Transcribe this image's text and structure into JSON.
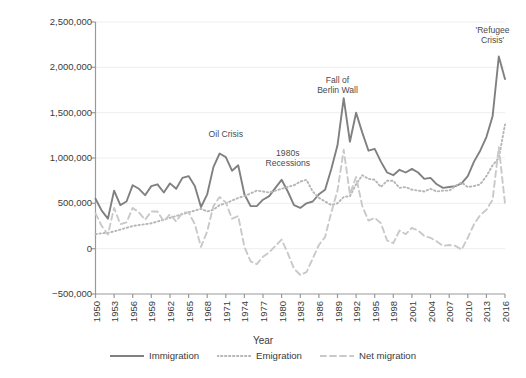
{
  "chart_data": {
    "type": "line",
    "title": "",
    "xlabel": "Year",
    "ylabel": "Migration",
    "ylim": [
      -500000,
      2500000
    ],
    "xlim": [
      1950,
      2016
    ],
    "grid": true,
    "legend_position": "bottom",
    "ytick_labels": [
      "2,500,000",
      "2,000,000",
      "1,500,000",
      "1,000,000",
      "500,000",
      "0",
      "−500,000"
    ],
    "ytick_values": [
      2500000,
      2000000,
      1500000,
      1000000,
      500000,
      0,
      -500000
    ],
    "xtick_labels": [
      "1950",
      "1953",
      "1956",
      "1959",
      "1962",
      "1965",
      "1968",
      "1971",
      "1974",
      "1977",
      "1980",
      "1983",
      "1986",
      "1989",
      "1992",
      "1995",
      "1998",
      "2001",
      "2004",
      "2007",
      "2010",
      "2013",
      "2016"
    ],
    "xtick_values": [
      1950,
      1953,
      1956,
      1959,
      1962,
      1965,
      1968,
      1971,
      1974,
      1977,
      1980,
      1983,
      1986,
      1989,
      1992,
      1995,
      1998,
      2001,
      2004,
      2007,
      2010,
      2013,
      2016
    ],
    "x": [
      1950,
      1951,
      1952,
      1953,
      1954,
      1955,
      1956,
      1957,
      1958,
      1959,
      1960,
      1961,
      1962,
      1963,
      1964,
      1965,
      1966,
      1967,
      1968,
      1969,
      1970,
      1971,
      1972,
      1973,
      1974,
      1975,
      1976,
      1977,
      1978,
      1979,
      1980,
      1981,
      1982,
      1983,
      1984,
      1985,
      1986,
      1987,
      1988,
      1989,
      1990,
      1991,
      1992,
      1993,
      1994,
      1995,
      1996,
      1997,
      1998,
      1999,
      2000,
      2001,
      2002,
      2003,
      2004,
      2005,
      2006,
      2007,
      2008,
      2009,
      2010,
      2011,
      2012,
      2013,
      2014,
      2015,
      2016
    ],
    "series": [
      {
        "name": "Immigration",
        "style": "solid",
        "color": "#808080",
        "values": [
          550000,
          420000,
          330000,
          640000,
          480000,
          520000,
          700000,
          660000,
          590000,
          690000,
          710000,
          620000,
          720000,
          660000,
          780000,
          800000,
          690000,
          460000,
          600000,
          900000,
          1050000,
          1010000,
          860000,
          920000,
          600000,
          470000,
          470000,
          540000,
          580000,
          670000,
          760000,
          630000,
          480000,
          450000,
          500000,
          520000,
          600000,
          650000,
          880000,
          1140000,
          1660000,
          1180000,
          1500000,
          1280000,
          1080000,
          1100000,
          960000,
          840000,
          810000,
          870000,
          840000,
          880000,
          840000,
          770000,
          780000,
          710000,
          670000,
          680000,
          690000,
          720000,
          800000,
          960000,
          1080000,
          1230000,
          1460000,
          2120000,
          1870000
        ]
      },
      {
        "name": "Emigration",
        "style": "dotted",
        "color": "#b6b6b6",
        "values": [
          160000,
          170000,
          175000,
          190000,
          210000,
          230000,
          250000,
          260000,
          270000,
          280000,
          300000,
          320000,
          340000,
          360000,
          380000,
          400000,
          420000,
          440000,
          410000,
          430000,
          480000,
          500000,
          530000,
          560000,
          580000,
          610000,
          640000,
          630000,
          620000,
          640000,
          660000,
          680000,
          700000,
          740000,
          760000,
          630000,
          560000,
          520000,
          480000,
          500000,
          570000,
          580000,
          710000,
          810000,
          770000,
          760000,
          680000,
          750000,
          750000,
          670000,
          680000,
          650000,
          640000,
          630000,
          660000,
          630000,
          640000,
          640000,
          690000,
          730000,
          680000,
          690000,
          710000,
          800000,
          920000,
          1000000,
          1370000
        ]
      },
      {
        "name": "Net migration",
        "style": "dashed",
        "color": "#c9c9c9",
        "values": [
          390000,
          250000,
          155000,
          450000,
          270000,
          290000,
          450000,
          400000,
          320000,
          410000,
          410000,
          300000,
          380000,
          300000,
          400000,
          400000,
          270000,
          20000,
          190000,
          470000,
          570000,
          510000,
          330000,
          360000,
          20000,
          -140000,
          -170000,
          -90000,
          -40000,
          30000,
          100000,
          -50000,
          -220000,
          -290000,
          -260000,
          -110000,
          40000,
          130000,
          400000,
          640000,
          1090000,
          600000,
          790000,
          470000,
          310000,
          340000,
          280000,
          90000,
          60000,
          200000,
          160000,
          230000,
          200000,
          140000,
          120000,
          80000,
          30000,
          40000,
          30000,
          -10000,
          120000,
          270000,
          370000,
          430000,
          540000,
          1120000,
          500000
        ]
      }
    ],
    "annotations": [
      {
        "label": "Oil Crisis",
        "x": 1971,
        "y": 1250000
      },
      {
        "label": "1980s\nRecessions",
        "x": 1981,
        "y": 1050000
      },
      {
        "label": "Fall of\nBerlin Wall",
        "x": 1989,
        "y": 1850000
      },
      {
        "label": "'Refugee\nCrisis'",
        "x": 2014,
        "y": 2400000
      }
    ]
  },
  "legend": {
    "items": [
      {
        "label": "Immigration",
        "style": "solid",
        "color": "#808080"
      },
      {
        "label": "Emigration",
        "style": "dotted",
        "color": "#b6b6b6"
      },
      {
        "label": "Net migration",
        "style": "dashed",
        "color": "#c9c9c9"
      }
    ]
  }
}
